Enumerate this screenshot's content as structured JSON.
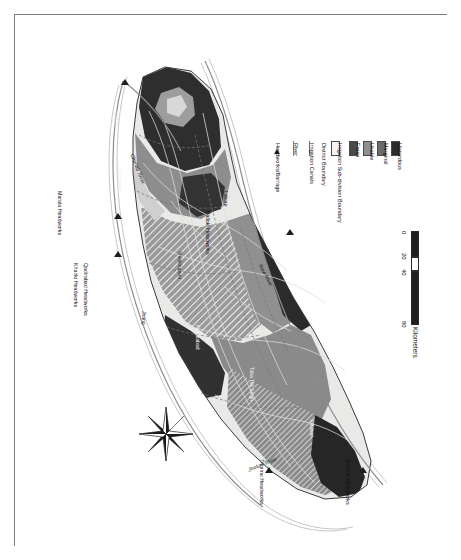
{
  "figure": {
    "type": "map"
  },
  "legend": {
    "entries": [
      {
        "label": "Headworks/Barrage",
        "symbol": "triangle-marker",
        "color": "#222222"
      },
      {
        "label": "River",
        "symbol": "line",
        "color": "#7a7a7a"
      },
      {
        "label": "Irrigation Canals",
        "symbol": "line",
        "color": "#6d6d6d"
      },
      {
        "label": "District Boundary",
        "symbol": "line",
        "color": "#6d6d6d"
      },
      {
        "label": "Irrigation Sub-division Boundary",
        "symbol": "swatch-outline",
        "color": "#f4f4f2"
      },
      {
        "label": "Fresh",
        "symbol": "swatch",
        "color": "#4a4a4a"
      },
      {
        "label": "Usable",
        "symbol": "swatch",
        "color": "#8f8f8f"
      },
      {
        "label": "Marginal",
        "symbol": "swatch",
        "color": "#6b6b6b"
      },
      {
        "label": "Hazardous",
        "symbol": "swatch",
        "color": "#2b2b2b"
      }
    ]
  },
  "scalebar": {
    "title": "Kilometers",
    "ticks": [
      "0",
      "20",
      "40",
      "80"
    ]
  },
  "compass": {
    "label": "north-arrow"
  },
  "map_labels": {
    "headworks": [
      {
        "name": "Marala Headworks"
      },
      {
        "name": "Khanki Headworks"
      },
      {
        "name": "Qadirabad Headworks"
      },
      {
        "name": "Balloki Headworks"
      },
      {
        "name": "Trimmu Headworks"
      },
      {
        "name": "Sidhnai Headworks"
      }
    ],
    "rivers": [
      {
        "name": "Chenab River"
      },
      {
        "name": "Ravi River"
      },
      {
        "name": "Jhelum River"
      }
    ],
    "districts": [
      {
        "name": "Sialkot"
      },
      {
        "name": "Gujranwala"
      },
      {
        "name": "Sheikhupura"
      },
      {
        "name": "Faisalabad"
      },
      {
        "name": "Jhang"
      },
      {
        "name": "Toba Tek Singh"
      },
      {
        "name": "Sahiwal"
      },
      {
        "name": "Lahore"
      }
    ]
  }
}
